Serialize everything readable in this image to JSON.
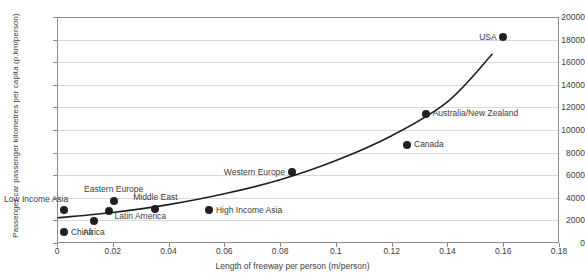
{
  "chart_data": {
    "type": "scatter",
    "title": "",
    "xlabel": "Length of freeway per person (m/person)",
    "ylabel": "Passenger car passenger kilometres per capita (p.km/person)",
    "xlim": [
      0,
      0.18
    ],
    "ylim": [
      0,
      20000
    ],
    "xticks": [
      "0",
      "0.02",
      "0.04",
      "0.06",
      "0.08",
      "0.1",
      "0.12",
      "0.14",
      "0.16",
      "0.18"
    ],
    "xtick_values": [
      0,
      0.02,
      0.04,
      0.06,
      0.08,
      0.1,
      0.12,
      0.14,
      0.16,
      0.18
    ],
    "yticks": [
      "0",
      "2000",
      "4000",
      "6000",
      "8000",
      "10000",
      "12000",
      "14000",
      "16000",
      "18000",
      "20000"
    ],
    "ytick_values": [
      0,
      2000,
      4000,
      6000,
      8000,
      10000,
      12000,
      14000,
      16000,
      18000,
      20000
    ],
    "grid": true,
    "legend": "none",
    "marker_color": "#231f20",
    "trend_color": "#231f20",
    "points": [
      {
        "label": "Low Income Asia",
        "x": 0.0025,
        "y": 2900,
        "label_pos": "above-left"
      },
      {
        "label": "China",
        "x": 0.0025,
        "y": 950,
        "label_pos": "right"
      },
      {
        "label": "Africa",
        "x": 0.0133,
        "y": 1980,
        "label_pos": "below"
      },
      {
        "label": "Latin America",
        "x": 0.0185,
        "y": 2800,
        "label_pos": "below-right"
      },
      {
        "label": "Eastern Europe",
        "x": 0.0203,
        "y": 3750,
        "label_pos": "above"
      },
      {
        "label": "Middle East",
        "x": 0.0352,
        "y": 3020,
        "label_pos": "above"
      },
      {
        "label": "High Income Asia",
        "x": 0.0545,
        "y": 2900,
        "label_pos": "right"
      },
      {
        "label": "Western Europe",
        "x": 0.0842,
        "y": 6250,
        "label_pos": "left"
      },
      {
        "label": "Canada",
        "x": 0.1255,
        "y": 8700,
        "label_pos": "right"
      },
      {
        "label": "Australia/New Zealand",
        "x": 0.1322,
        "y": 11450,
        "label_pos": "right"
      },
      {
        "label": "USA",
        "x": 0.16,
        "y": 18200,
        "label_pos": "left"
      }
    ],
    "trend": {
      "description": "fitted upward-curving trend line",
      "points": [
        {
          "x": 0.0004,
          "y": 2240
        },
        {
          "x": 0.02,
          "y": 2700
        },
        {
          "x": 0.04,
          "y": 3400
        },
        {
          "x": 0.06,
          "y": 4350
        },
        {
          "x": 0.08,
          "y": 5600
        },
        {
          "x": 0.1,
          "y": 7300
        },
        {
          "x": 0.12,
          "y": 9500
        },
        {
          "x": 0.14,
          "y": 12500
        },
        {
          "x": 0.156,
          "y": 16700
        }
      ]
    }
  }
}
